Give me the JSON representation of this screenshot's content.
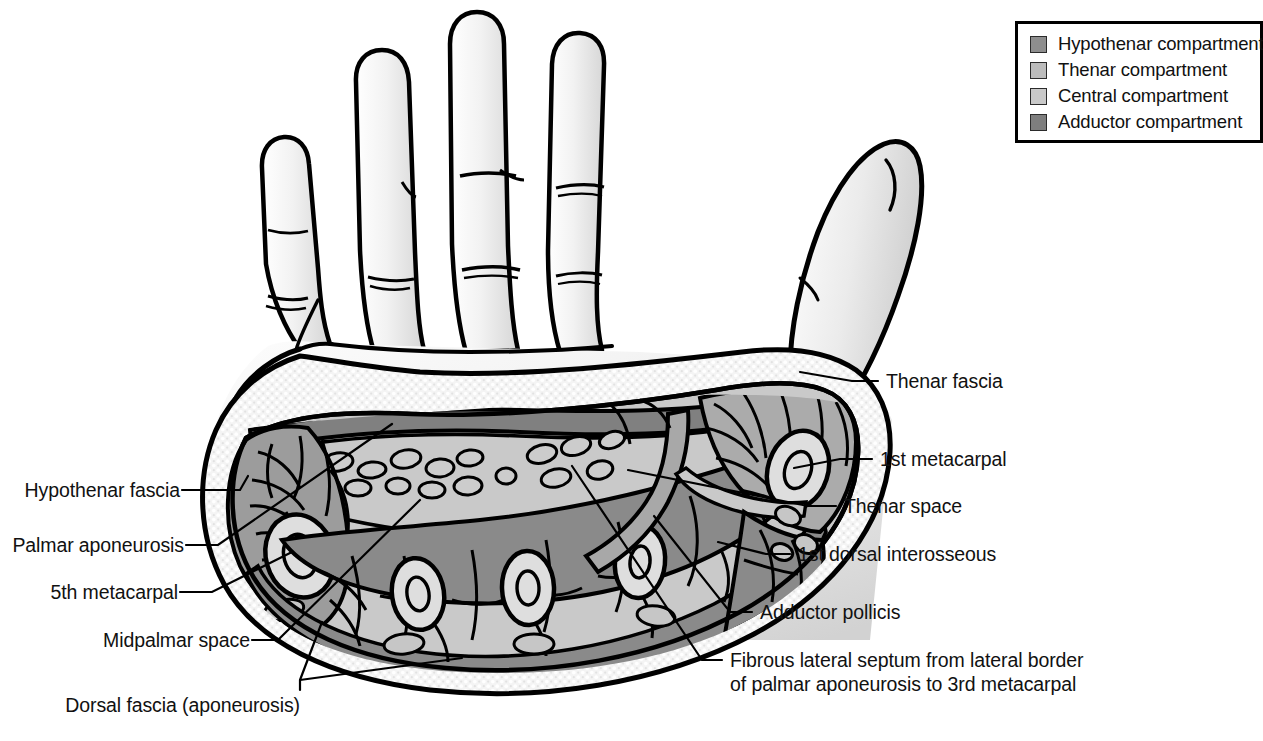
{
  "figure": {
    "type": "anatomical-diagram"
  },
  "legend": {
    "items": [
      {
        "label": "Hypothenar compartment",
        "color": "#8e8e8e"
      },
      {
        "label": "Thenar compartment",
        "color": "#bcbcbc"
      },
      {
        "label": "Central compartment",
        "color": "#c9c9c9"
      },
      {
        "label": "Adductor compartment",
        "color": "#7e7e7e"
      }
    ]
  },
  "labels": {
    "left": [
      {
        "key": "hypothenar_fascia",
        "text": "Hypothenar fascia"
      },
      {
        "key": "palmar_aponeurosis",
        "text": "Palmar aponeurosis"
      },
      {
        "key": "fifth_metacarpal",
        "text": "5th metacarpal"
      },
      {
        "key": "midpalmar_space",
        "text": "Midpalmar space"
      },
      {
        "key": "dorsal_fascia",
        "text": "Dorsal fascia (aponeurosis)"
      }
    ],
    "right": [
      {
        "key": "thenar_fascia",
        "text": "Thenar fascia"
      },
      {
        "key": "first_metacarpal",
        "text": "1st metacarpal"
      },
      {
        "key": "thenar_space",
        "text": "Thenar space"
      },
      {
        "key": "first_dorsal_interosseous",
        "text": "1st dorsal interosseous"
      },
      {
        "key": "adductor_pollicis",
        "text": "Adductor pollicis"
      },
      {
        "key": "fibrous_septum_line1",
        "text": "Fibrous lateral septum from lateral border"
      },
      {
        "key": "fibrous_septum_line2",
        "text": "of palmar aponeurosis to 3rd metacarpal"
      }
    ]
  },
  "colors": {
    "skin": "#efefef",
    "skin_shadow": "#d9d9d9",
    "outline": "#000000",
    "fat_stipple": "#ededed",
    "hypothenar": "#9c9c9c",
    "thenar": "#ababab",
    "central": "#c9c9c9",
    "adductor": "#8a8a8a",
    "bone": "#dedede",
    "aponeurosis_band": "#808080",
    "tendon": "#cccccc",
    "leader": "#000000"
  }
}
